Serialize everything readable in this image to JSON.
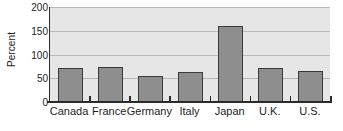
{
  "chart_data": {
    "type": "bar",
    "title": "",
    "xlabel": "",
    "ylabel": "Percent",
    "categories": [
      "Canada",
      "France",
      "Germany",
      "Italy",
      "Japan",
      "U.K.",
      "U.S."
    ],
    "values": [
      72,
      74,
      54,
      63,
      160,
      71,
      66
    ],
    "ylim": [
      0,
      200
    ],
    "yticks": [
      0,
      50,
      100,
      150,
      200
    ],
    "ytick_labels": [
      "0",
      "50",
      "100",
      "150",
      "200"
    ],
    "grid": true,
    "grid_axis": "y",
    "legend": false,
    "legend_position": "none",
    "bar_color": "#8e8e8e",
    "bar_edge_color": "#3a3a3a",
    "plot_background": "#e6e6e6",
    "axis_color": "#2b2b2b",
    "gridline_color": "#b9b9b9",
    "figure_background": "#ffffff"
  }
}
